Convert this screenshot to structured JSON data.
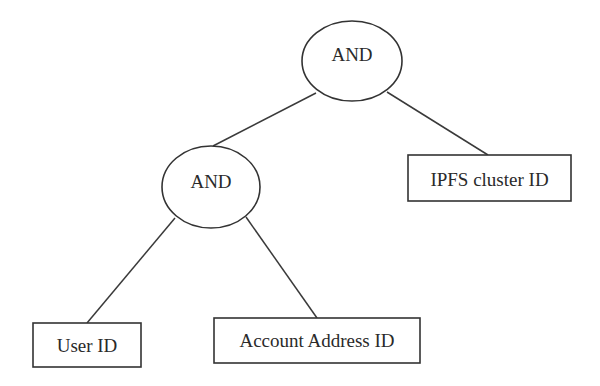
{
  "diagram": {
    "type": "and-tree",
    "nodes": [
      {
        "id": "root",
        "shape": "ellipse",
        "label": "AND"
      },
      {
        "id": "and2",
        "shape": "ellipse",
        "label": "AND"
      },
      {
        "id": "ipfs",
        "shape": "rect",
        "label": "IPFS cluster ID"
      },
      {
        "id": "user",
        "shape": "rect",
        "label": "User ID"
      },
      {
        "id": "account",
        "shape": "rect",
        "label": "Account Address ID"
      }
    ],
    "edges": [
      {
        "from": "root",
        "to": "and2"
      },
      {
        "from": "root",
        "to": "ipfs"
      },
      {
        "from": "and2",
        "to": "user"
      },
      {
        "from": "and2",
        "to": "account"
      }
    ]
  },
  "labels": {
    "root": "AND",
    "and2": "AND",
    "ipfs": "IPFS cluster ID",
    "user": "User ID",
    "account": "Account Address ID"
  },
  "colors": {
    "stroke": "#333333",
    "text": "#2a2a2a",
    "background": "#ffffff"
  }
}
